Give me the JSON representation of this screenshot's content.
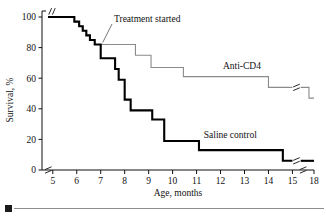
{
  "figure": {
    "caption_marker": "filled-square-bullet"
  },
  "chart_data": {
    "type": "line",
    "subtype": "kaplan-meier-step",
    "title": "",
    "xlabel": "Age, months",
    "ylabel": "Survival, %",
    "xlim": [
      4.55,
      18.0
    ],
    "ylim": [
      0,
      100
    ],
    "grid": false,
    "legend_position": "inline-labels",
    "x_ticks": [
      5,
      6,
      7,
      8,
      9,
      10,
      11,
      12,
      13,
      14,
      15,
      18
    ],
    "x_tick_labels": [
      "5",
      "6",
      "7",
      "8",
      "9",
      "10",
      "11",
      "12",
      "13",
      "14",
      "15",
      "18"
    ],
    "y_ticks": [
      0,
      20,
      40,
      60,
      80,
      100
    ],
    "y_tick_labels": [
      "0",
      "20",
      "40",
      "60",
      "80",
      "100"
    ],
    "axis_breaks": [
      {
        "axis": "x",
        "between": [
          15,
          18
        ],
        "style": "double-slash"
      },
      {
        "axis": "x",
        "between": [
          0,
          5
        ],
        "style": "double-slash"
      },
      {
        "axis": "y",
        "between": [
          100,
          105
        ],
        "style": "double-slash"
      }
    ],
    "annotations": [
      {
        "text": "Treatment started",
        "target_x": 7.0,
        "target_y": 82,
        "leader": true
      }
    ],
    "series": [
      {
        "name": "Anti-CD4",
        "color": "#8a8a8a",
        "line_width": 1.1,
        "label_x": 12.1,
        "label_y": 66,
        "break_after_x": 15.0,
        "points": [
          [
            4.8,
            100
          ],
          [
            5.9,
            100
          ],
          [
            5.9,
            97
          ],
          [
            6.1,
            97
          ],
          [
            6.1,
            94
          ],
          [
            6.25,
            94
          ],
          [
            6.25,
            91
          ],
          [
            6.4,
            91
          ],
          [
            6.4,
            88
          ],
          [
            6.55,
            88
          ],
          [
            6.55,
            85
          ],
          [
            6.75,
            85
          ],
          [
            6.75,
            82
          ],
          [
            8.45,
            82
          ],
          [
            8.45,
            75
          ],
          [
            9.1,
            75
          ],
          [
            9.1,
            67
          ],
          [
            10.45,
            67
          ],
          [
            10.45,
            61
          ],
          [
            14.0,
            61
          ],
          [
            14.0,
            54
          ],
          [
            15.0,
            54
          ],
          [
            17.3,
            54
          ],
          [
            17.3,
            47
          ],
          [
            18.0,
            47
          ]
        ]
      },
      {
        "name": "Saline control",
        "color": "#000000",
        "line_width": 2.1,
        "label_x": 11.3,
        "label_y": 21,
        "break_after_x": 15.0,
        "points": [
          [
            4.8,
            100
          ],
          [
            5.9,
            100
          ],
          [
            5.9,
            97
          ],
          [
            6.1,
            97
          ],
          [
            6.1,
            94
          ],
          [
            6.25,
            94
          ],
          [
            6.25,
            91
          ],
          [
            6.4,
            91
          ],
          [
            6.4,
            88
          ],
          [
            6.55,
            88
          ],
          [
            6.55,
            85
          ],
          [
            6.75,
            85
          ],
          [
            6.75,
            82
          ],
          [
            7.0,
            82
          ],
          [
            7.0,
            73
          ],
          [
            7.6,
            73
          ],
          [
            7.6,
            66
          ],
          [
            7.75,
            66
          ],
          [
            7.75,
            59
          ],
          [
            8.0,
            59
          ],
          [
            8.0,
            46
          ],
          [
            8.25,
            46
          ],
          [
            8.25,
            39
          ],
          [
            9.15,
            39
          ],
          [
            9.15,
            33
          ],
          [
            9.65,
            33
          ],
          [
            9.65,
            19
          ],
          [
            11.1,
            19
          ],
          [
            11.1,
            13
          ],
          [
            14.6,
            13
          ],
          [
            14.6,
            6
          ],
          [
            15.0,
            6
          ],
          [
            17.3,
            6
          ],
          [
            18.0,
            6
          ]
        ]
      }
    ]
  }
}
